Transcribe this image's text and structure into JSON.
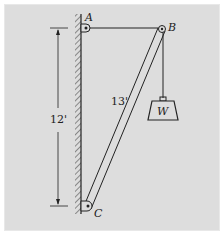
{
  "diagram": {
    "labels": {
      "A": "A",
      "B": "B",
      "C": "C",
      "W": "W"
    },
    "dimensions": {
      "height": "12'",
      "boom_length": "13'"
    },
    "colors": {
      "panel": "#dddddd",
      "line": "#222222"
    }
  }
}
